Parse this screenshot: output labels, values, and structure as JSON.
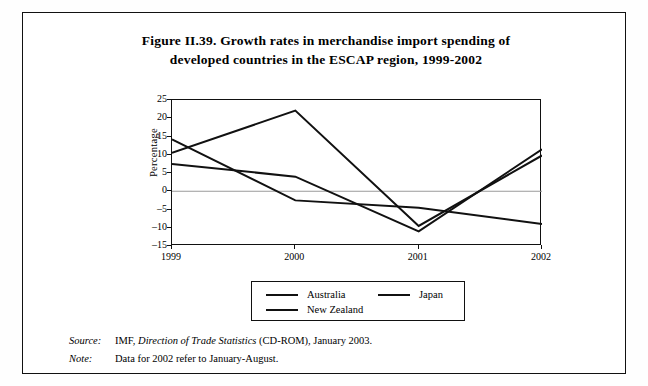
{
  "figure": {
    "title_line1": "Figure II.39. Growth rates in merchandise import spending of",
    "title_line2": "developed countries in the ESCAP region, 1999-2002"
  },
  "notes": {
    "source_label": "Source:",
    "source_text_pre": "IMF, ",
    "source_text_italic": "Direction of Trade Statistics",
    "source_text_post": " (CD-ROM), January 2003.",
    "note_label": "Note:",
    "note_text": "Data for 2002 refer to January-August."
  },
  "chart_data": {
    "type": "line",
    "title": "Figure II.39. Growth rates in merchandise import spending of developed countries in the ESCAP region, 1999-2002",
    "xlabel": "",
    "ylabel": "Percentage",
    "categories": [
      "1999",
      "2000",
      "2001",
      "2002"
    ],
    "x_tick_labels": [
      "1999",
      "2000",
      "2001",
      "2002"
    ],
    "y_tick_labels": [
      "25",
      "20",
      "15",
      "10",
      "5",
      "0",
      "-5",
      "-10",
      "-15"
    ],
    "y_ticks": [
      25,
      20,
      15,
      10,
      5,
      0,
      -5,
      -10,
      -15
    ],
    "ylim": [
      -15,
      25
    ],
    "grid": false,
    "zero_line": true,
    "legend_position": "bottom",
    "line_color": "#111111",
    "series": [
      {
        "name": "Australia",
        "values": [
          7.5,
          4.0,
          -11.0,
          11.5
        ]
      },
      {
        "name": "Japan",
        "values": [
          10.5,
          22.1,
          -9.5,
          9.8
        ]
      },
      {
        "name": "New Zealand",
        "values": [
          14.2,
          -2.5,
          -4.5,
          -9.0
        ]
      }
    ]
  }
}
